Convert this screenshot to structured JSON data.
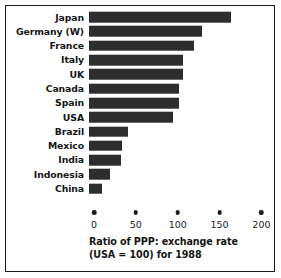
{
  "chart_data": {
    "type": "bar",
    "orientation": "horizontal",
    "title": "",
    "caption_line1": "Ratio of PPP: exchange rate",
    "caption_line2": "(USA = 100) for 1988",
    "xlabel": "",
    "ylabel": "",
    "xlim": [
      0,
      215
    ],
    "grid": false,
    "legend": null,
    "bar_color": "#2d2d2d",
    "axis_ticks": [
      0,
      50,
      100,
      150,
      200
    ],
    "tick_labels": [
      "0",
      "50",
      "100",
      "150",
      "200"
    ],
    "categories": [
      "Japan",
      "Germany (W)",
      "France",
      "Italy",
      "UK",
      "Canada",
      "Spain",
      "USA",
      "Brazil",
      "Mexico",
      "India",
      "Indonesia",
      "China"
    ],
    "values": [
      170,
      135,
      126,
      112,
      112,
      108,
      107,
      100,
      47,
      40,
      38,
      25,
      15
    ]
  }
}
